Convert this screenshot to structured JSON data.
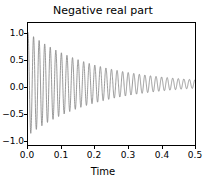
{
  "chart_data": {
    "type": "line",
    "title": "Negative real part",
    "xlabel": "Time",
    "ylabel": "",
    "xlim": [
      0.0,
      0.5
    ],
    "ylim": [
      -1.15,
      1.15
    ],
    "grid": false,
    "legend": null,
    "line_color": "#808080",
    "line_width": 0.8,
    "xticks": [
      0.0,
      0.1,
      0.2,
      0.3,
      0.4,
      0.5
    ],
    "xticklabels": [
      "0.0",
      "0.1",
      "0.2",
      "0.3",
      "0.4",
      "0.5"
    ],
    "yticks": [
      1.0,
      0.5,
      0.0,
      -0.5,
      -1.0
    ],
    "yticklabels": [
      "1.0",
      "0.5",
      "0.0",
      "−0.5",
      "−1.0"
    ],
    "series": [
      {
        "name": "damped oscillation",
        "amplitude": 0.97,
        "decay_rate": -5.0,
        "frequency_hz": 60.0,
        "phase": 0.0,
        "n_points": 2000,
        "envelope_samples": [
          {
            "t": 0.0,
            "amplitude": 0.97
          },
          {
            "t": 0.05,
            "amplitude": 0.755
          },
          {
            "t": 0.1,
            "amplitude": 0.588
          },
          {
            "t": 0.15,
            "amplitude": 0.458
          },
          {
            "t": 0.2,
            "amplitude": 0.357
          },
          {
            "t": 0.25,
            "amplitude": 0.278
          },
          {
            "t": 0.3,
            "amplitude": 0.216
          },
          {
            "t": 0.35,
            "amplitude": 0.168
          },
          {
            "t": 0.4,
            "amplitude": 0.131
          },
          {
            "t": 0.45,
            "amplitude": 0.102
          },
          {
            "t": 0.5,
            "amplitude": 0.08
          }
        ]
      }
    ]
  }
}
